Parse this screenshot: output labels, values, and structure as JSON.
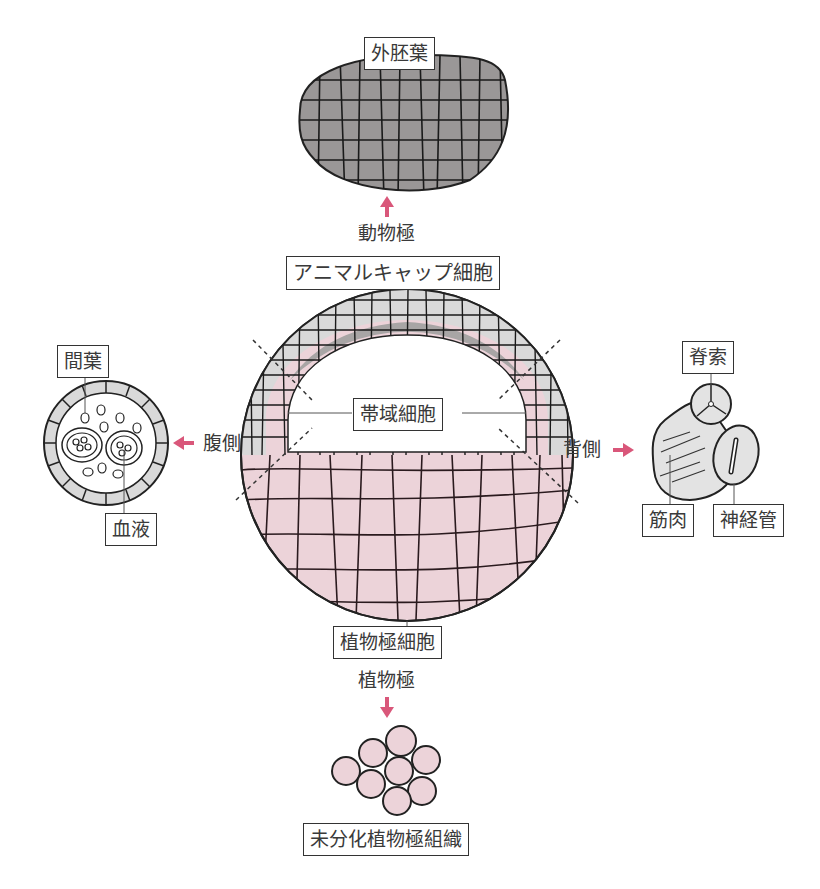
{
  "diagram": {
    "type": "embryonic tissue fate diagram (animal cap / equatorial zone / vegetal pole)",
    "colors": {
      "arrow": "#d9577a",
      "ectoderm_fill": "#9a9797",
      "animal_cap_fill": "#a8a5a5",
      "marginal_fill": "#d9d9d9",
      "vegetal_fill": "#ecd3d9",
      "outline": "#222222"
    },
    "top": {
      "result_label": "外胚葉",
      "pole_label": "動物極",
      "source_label": "アニマルキャップ細胞"
    },
    "center": {
      "zone_label": "帯域細胞"
    },
    "left": {
      "direction_label": "腹側",
      "labels": [
        "間葉",
        "血液"
      ]
    },
    "right": {
      "direction_label": "背側",
      "labels": [
        "脊索",
        "筋肉",
        "神経管"
      ]
    },
    "bottom": {
      "source_label": "植物極細胞",
      "pole_label": "植物極",
      "result_label": "未分化植物極組織"
    }
  }
}
